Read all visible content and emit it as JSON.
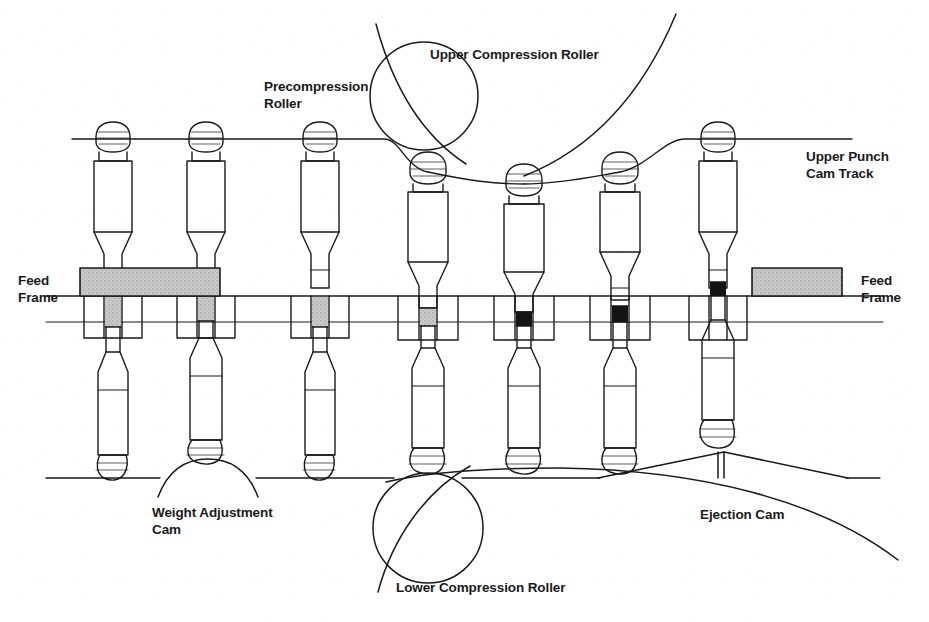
{
  "diagram": {
    "type": "mechanical-cross-section",
    "colors": {
      "line": "#1a1a1a",
      "powder_fill": "#c9c9c9",
      "tablet_fill": "#141414",
      "background": "#ffffff",
      "text": "#1a1a1a"
    },
    "labels": [
      {
        "id": "precompression-roller",
        "text": "Precompression\nRoller",
        "x": 264,
        "y": 78
      },
      {
        "id": "upper-compression-roller",
        "text": "Upper Compression Roller",
        "x": 430,
        "y": 46
      },
      {
        "id": "upper-punch-cam-track",
        "text": "Upper Punch\nCam Track",
        "x": 806,
        "y": 148
      },
      {
        "id": "feed-frame-left",
        "text": "Feed\nFrame",
        "x": 18,
        "y": 272
      },
      {
        "id": "feed-frame-right",
        "text": "Feed\nFrame",
        "x": 861,
        "y": 272
      },
      {
        "id": "weight-adjustment-cam",
        "text": "Weight Adjustment\nCam",
        "x": 152,
        "y": 504
      },
      {
        "id": "ejection-cam",
        "text": "Ejection Cam",
        "x": 700,
        "y": 506
      },
      {
        "id": "lower-compression-roller",
        "text": "Lower Compression Roller",
        "x": 396,
        "y": 579
      }
    ],
    "stations": [
      {
        "index": 1,
        "name": "fill-station-1",
        "x": 113,
        "upper_punch_y": 128,
        "lower_punch_y": 330,
        "die_fill": "powder",
        "die_fill_level": "full"
      },
      {
        "index": 2,
        "name": "weight-adjust-station",
        "x": 206,
        "upper_punch_y": 128,
        "lower_punch_y": 316,
        "die_fill": "powder",
        "die_fill_level": "full"
      },
      {
        "index": 3,
        "name": "excess-scrape-station",
        "x": 320,
        "upper_punch_y": 128,
        "lower_punch_y": 330,
        "die_fill": "powder",
        "die_fill_level": "full"
      },
      {
        "index": 4,
        "name": "precompression-station",
        "x": 428,
        "upper_punch_y": 162,
        "lower_punch_y": 322,
        "die_fill": "powder",
        "die_fill_level": "partial"
      },
      {
        "index": 5,
        "name": "main-compression-station",
        "x": 524,
        "upper_punch_y": 173,
        "lower_punch_y": 322,
        "die_fill": "tablet",
        "die_fill_level": "compressed"
      },
      {
        "index": 6,
        "name": "post-compression-station",
        "x": 620,
        "upper_punch_y": 162,
        "lower_punch_y": 322,
        "die_fill": "tablet",
        "die_fill_level": "compressed"
      },
      {
        "index": 7,
        "name": "ejection-station",
        "x": 718,
        "upper_punch_y": 128,
        "lower_punch_y": 288,
        "die_fill": "tablet",
        "die_fill_level": "ejected"
      }
    ],
    "components": {
      "upper_cam_track_label": "Upper Punch Cam Track",
      "die_table_label": "Die Table",
      "feed_frame_left": {
        "x": 80,
        "y": 268,
        "width": 140,
        "height": 28
      },
      "feed_frame_right": {
        "x": 752,
        "y": 268,
        "width": 90,
        "height": 28
      },
      "precompression_roller_upper": {
        "cx": 424,
        "cy": 95,
        "r": 54
      },
      "upper_compression_roller": {
        "cx": 560,
        "cy": -150,
        "r": 330
      },
      "precompression_roller_lower": {
        "cx": 426,
        "cy": 528,
        "r": 55
      },
      "lower_compression_roller": {
        "cx": 560,
        "cy": 780,
        "r": 310
      },
      "weight_adjustment_cam": {
        "cx": 206,
        "cy": 545,
        "r": 80
      },
      "ejection_cam": {
        "x_start": 598,
        "x_peak": 724,
        "x_end": 848,
        "y_base": 478,
        "y_peak": 452
      }
    }
  }
}
